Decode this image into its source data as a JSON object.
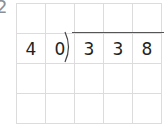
{
  "problem_number": "2",
  "division": {
    "divisor": [
      "4",
      "0"
    ],
    "dividend": [
      "3",
      "3",
      "8"
    ]
  },
  "grid": {
    "columns": 5,
    "rows": 4
  },
  "rows": [
    [
      "",
      "",
      "",
      "",
      ""
    ],
    [
      "4",
      "0",
      "3",
      "3",
      "8"
    ],
    [
      "",
      "",
      "",
      "",
      ""
    ],
    [
      "",
      "",
      "",
      "",
      ""
    ]
  ]
}
